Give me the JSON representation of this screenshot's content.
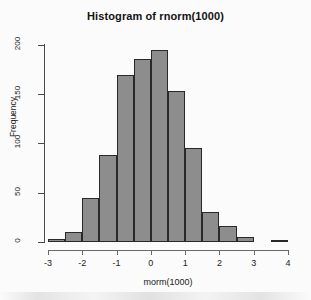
{
  "chart_data": {
    "type": "bar",
    "title": "Histogram of rnorm(1000)",
    "xlabel": "morm(1000)",
    "ylabel": "Frequency",
    "bin_width": 0.5,
    "bin_edges": [
      -3.0,
      -2.5,
      -2.0,
      -1.5,
      -1.0,
      -0.5,
      0.0,
      0.5,
      1.0,
      1.5,
      2.0,
      2.5,
      3.0,
      3.5,
      4.0
    ],
    "categories": [
      "-3.0 to -2.5",
      "-2.5 to -2.0",
      "-2.0 to -1.5",
      "-1.5 to -1.0",
      "-1.0 to -0.5",
      "-0.5 to 0.0",
      "0.0 to 0.5",
      "0.5 to 1.0",
      "1.0 to 1.5",
      "1.5 to 2.0",
      "2.0 to 2.5",
      "2.5 to 3.0",
      "3.0 to 3.5",
      "3.5 to 4.0"
    ],
    "values": [
      3,
      10,
      45,
      88,
      170,
      186,
      195,
      153,
      95,
      30,
      16,
      5,
      0,
      1
    ],
    "xlim": [
      -3.0,
      4.0
    ],
    "ylim": [
      0,
      205
    ],
    "xticks": [
      "-3",
      "-2",
      "-1",
      "0",
      "1",
      "2",
      "3",
      "4"
    ],
    "xtick_values": [
      -3,
      -2,
      -1,
      0,
      1,
      2,
      3,
      4
    ],
    "yticks": [
      "0",
      "50",
      "100",
      "150",
      "200"
    ],
    "ytick_values": [
      0,
      50,
      100,
      150,
      200
    ],
    "grid": false,
    "legend": false,
    "bar_color": "#8e8e8e",
    "bar_border_color": "#2a2a2a",
    "background_color": "#fdfdfd"
  }
}
